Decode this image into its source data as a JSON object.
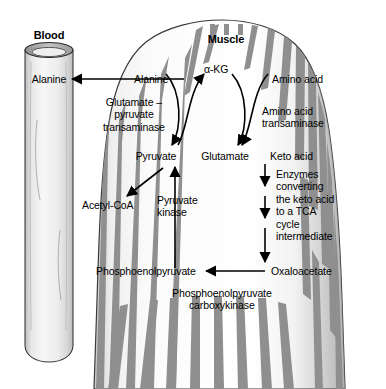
{
  "figure": {
    "title_blood": "Blood",
    "title_muscle": "Muscle",
    "colors": {
      "stripe": "#8f8f8f",
      "muscle_light": "#f2f2f2",
      "muscle_mid": "#d8d8d8",
      "muscle_dark": "#b0b0b0",
      "vessel_light": "#f0f0f0",
      "vessel_mid": "#d2d2d2",
      "outline": "#2b2b2b",
      "text": "#000000"
    },
    "labels": {
      "blood_alanine": "Alanine",
      "muscle_alanine": "Alanine",
      "alpha_kg": "α-KG",
      "amino_acid": "Amino acid",
      "glutamate_pyruvate_transaminase": "Glutamate –\npyruvate\ntransaminase",
      "amino_acid_transaminase": "Amino acid\ntransaminase",
      "pyruvate": "Pyruvate",
      "glutamate": "Glutamate",
      "keto_acid": "Keto acid",
      "acetyl_coa": "Acetyl-CoA",
      "pyruvate_kinase": "Pyruvate\nkinase",
      "enzymes_converting": "Enzymes\nconverting\nthe keto acid\nto a TCA\ncycle\nintermediate",
      "phosphoenolpyruvate": "Phosphoenolpyruvate",
      "oxaloacetate": "Oxaloacetate",
      "pepck": "Phosphoenolpyruvate\ncarboxykinase"
    }
  }
}
